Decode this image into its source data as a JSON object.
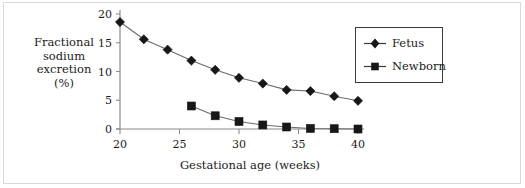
{
  "chart_data": {
    "type": "line",
    "title": "",
    "xlabel": "Gestational age (weeks)",
    "ylabel": "Fractional sodium excretion (%)",
    "ylabel_lines": [
      "Fractional",
      "sodium",
      "excretion",
      "(%)"
    ],
    "xlim": [
      20,
      40
    ],
    "ylim": [
      0,
      20
    ],
    "xticks": [
      20,
      25,
      30,
      35,
      40
    ],
    "xtick_labels": [
      "20",
      "25",
      "30",
      "35",
      "40"
    ],
    "yticks": [
      0,
      5,
      10,
      15,
      20
    ],
    "ytick_labels": [
      "0",
      "5",
      "10",
      "15",
      "20"
    ],
    "grid": false,
    "legend_position": "upper right",
    "series": [
      {
        "name": "Fetus",
        "marker": "diamond",
        "x": [
          20,
          22,
          24,
          26,
          28,
          30,
          32,
          34,
          36,
          38,
          40
        ],
        "values": [
          18.6,
          15.6,
          13.8,
          11.9,
          10.3,
          8.9,
          7.9,
          6.8,
          6.6,
          5.7,
          4.9
        ]
      },
      {
        "name": "Newborn",
        "marker": "square",
        "x": [
          26,
          28,
          30,
          32,
          34,
          36,
          38,
          40
        ],
        "values": [
          4.0,
          2.3,
          1.3,
          0.7,
          0.35,
          0.1,
          0.05,
          0.0
        ]
      }
    ]
  },
  "legend": {
    "items": [
      {
        "label": "Fetus"
      },
      {
        "label": "Newborn"
      }
    ]
  },
  "colors": {
    "marker": "#171717",
    "line": "#6b6b6b",
    "axis": "#8a8a8a",
    "frame": "#d9d9d9",
    "text": "#1a1a1a"
  }
}
